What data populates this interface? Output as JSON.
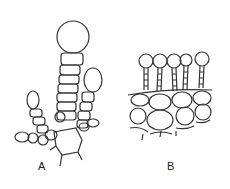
{
  "figure": {
    "panels": [
      {
        "label": "A",
        "description": "branched uniseriate hair with terminal swollen cells"
      },
      {
        "label": "B",
        "description": "row of stalked glandular hairs on epidermal tissue"
      }
    ],
    "line_color": "#333333"
  }
}
